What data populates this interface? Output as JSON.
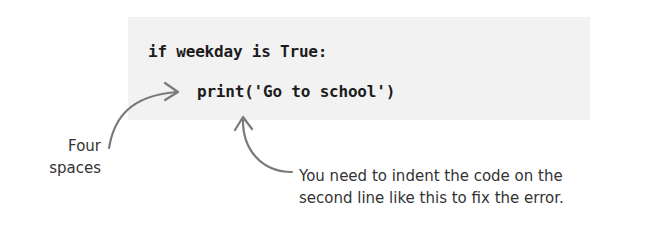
{
  "code_block": {
    "lines": [
      "if weekday is True:",
      "print('Go to school')"
    ],
    "background": "#f2f2f2",
    "text_color": "#1c1c1c"
  },
  "annotations": {
    "four_spaces": {
      "lines": [
        "Four",
        "spaces"
      ],
      "text": "Four\nspaces"
    },
    "indent_note": {
      "lines": [
        "You need to indent the code on the",
        "second line like this to fix the error."
      ],
      "text": "You need to indent the code on the\nsecond line like this to fix the error."
    }
  },
  "arrows": [
    {
      "name": "four-spaces-arrow",
      "from": "four-spaces-label",
      "to": "indented-code-line"
    },
    {
      "name": "indent-note-arrow",
      "from": "indent-note-label",
      "to": "indented-code-line"
    }
  ],
  "colors": {
    "arrow": "#7a7a7a",
    "annotation_text": "#333333"
  }
}
